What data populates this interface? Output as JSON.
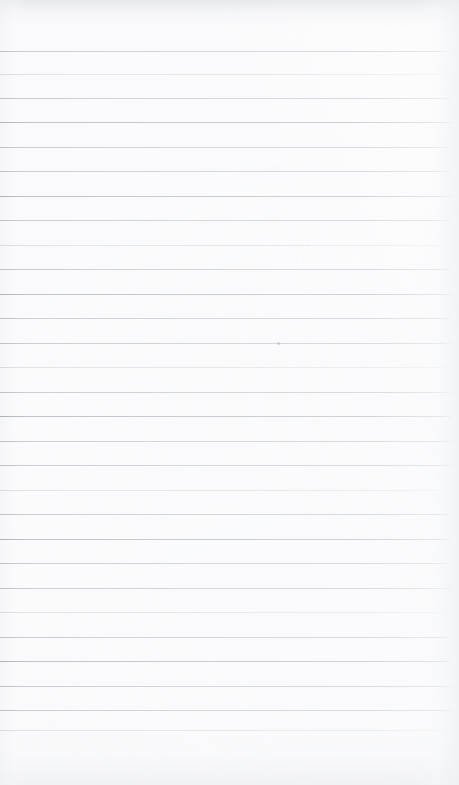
{
  "document": {
    "kind": "blank-lined-paper",
    "page_width": 459,
    "page_height": 785,
    "background_color": "#fdfdfe",
    "has_text": false,
    "text_content": "",
    "header_text": "",
    "footer_text": "",
    "page_number_text": ""
  },
  "ruling": {
    "line_color": "#ccd0d5",
    "line_color_strong": "#b9bec5",
    "line_color_faint": "#dadde1",
    "line_thickness_px": 1,
    "line_spacing_px": 24.6,
    "first_line_y": 51,
    "last_line_y": 730,
    "line_count": 28,
    "line_left_x": 0,
    "line_right_x": 453,
    "margin_top_px": 51,
    "margin_bottom_px": 55,
    "margin_rule_visible": false,
    "lines": [
      {
        "y": 51,
        "weight": "normal"
      },
      {
        "y": 74,
        "weight": "faint"
      },
      {
        "y": 98,
        "weight": "normal"
      },
      {
        "y": 122,
        "weight": "heavy"
      },
      {
        "y": 147,
        "weight": "normal"
      },
      {
        "y": 171,
        "weight": "normal"
      },
      {
        "y": 196,
        "weight": "heavy"
      },
      {
        "y": 220,
        "weight": "normal"
      },
      {
        "y": 245,
        "weight": "faint"
      },
      {
        "y": 269,
        "weight": "normal"
      },
      {
        "y": 294,
        "weight": "heavy"
      },
      {
        "y": 318,
        "weight": "normal"
      },
      {
        "y": 343,
        "weight": "normal"
      },
      {
        "y": 367,
        "weight": "faint"
      },
      {
        "y": 392,
        "weight": "normal"
      },
      {
        "y": 416,
        "weight": "heavy"
      },
      {
        "y": 441,
        "weight": "normal"
      },
      {
        "y": 465,
        "weight": "normal"
      },
      {
        "y": 490,
        "weight": "faint"
      },
      {
        "y": 514,
        "weight": "normal"
      },
      {
        "y": 539,
        "weight": "heavy"
      },
      {
        "y": 563,
        "weight": "normal"
      },
      {
        "y": 588,
        "weight": "normal"
      },
      {
        "y": 612,
        "weight": "faint"
      },
      {
        "y": 637,
        "weight": "normal"
      },
      {
        "y": 661,
        "weight": "heavy"
      },
      {
        "y": 686,
        "weight": "normal"
      },
      {
        "y": 710,
        "weight": "normal"
      },
      {
        "y": 730,
        "weight": "faint"
      }
    ]
  },
  "marks": {
    "specks": [
      {
        "x": 277,
        "y": 342,
        "size": 3
      }
    ]
  },
  "shading": {
    "top_band_color": "#e4e6e9",
    "bottom_band_color": "#eeeff1",
    "right_edge_color": "#eef0f2",
    "left_edge_color": "#f0f1f3"
  }
}
